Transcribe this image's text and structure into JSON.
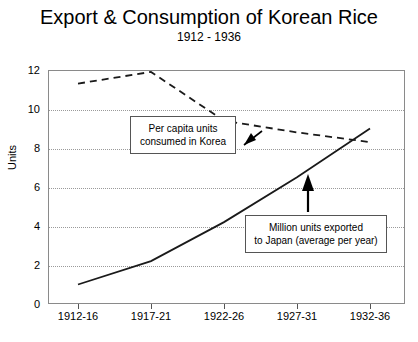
{
  "chart_data": {
    "type": "line",
    "title": "Export & Consumption of Korean Rice",
    "subtitle": "1912 - 1936",
    "xlabel": "",
    "ylabel": "Units",
    "ylim": [
      0,
      12
    ],
    "yticks": [
      0,
      2,
      4,
      6,
      8,
      10,
      12
    ],
    "grid": true,
    "legend": "none",
    "categories": [
      "1912-16",
      "1917-21",
      "1922-26",
      "1927-31",
      "1932-36"
    ],
    "series": [
      {
        "name": "Per capita units consumed in Korea",
        "style": "dashed",
        "color": "#1a1a1a",
        "values": [
          11.3,
          11.9,
          9.4,
          8.8,
          8.3
        ]
      },
      {
        "name": "Million units exported to Japan (average per year)",
        "style": "solid",
        "color": "#1a1a1a",
        "values": [
          1.0,
          2.2,
          4.2,
          6.5,
          9.0
        ]
      }
    ],
    "annotations": [
      {
        "id": "consumed",
        "line1": "Per capita units",
        "line2": "consumed in Korea",
        "arrow": "arrow-up-right",
        "points_to_series": "Per capita units consumed in Korea"
      },
      {
        "id": "exported",
        "line1": "Million units exported",
        "line2": "to Japan (average per year)",
        "arrow": "arrow-up",
        "points_to_series": "Million units exported to Japan (average per year)"
      }
    ]
  },
  "colors": {
    "background": "#ffffff",
    "axis": "#8a8a8a",
    "grid": "#9a9a9a",
    "line": "#1a1a1a",
    "text": "#000000"
  }
}
